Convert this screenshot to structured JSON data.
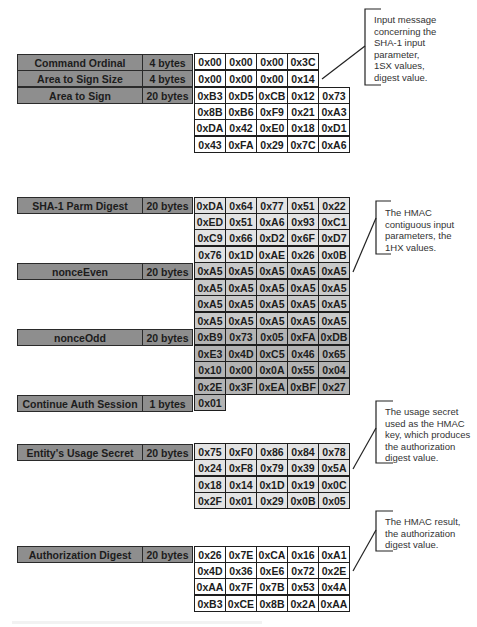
{
  "colors": {
    "label_fill": "#8e8e8e",
    "cell_white": "#ffffff",
    "cell_light": "#e3e3e3",
    "cell_mid": "#c9c9c9",
    "cell_dark": "#b3b3b3",
    "border": "#1e1e1e"
  },
  "input_message": {
    "fields": [
      {
        "label": "Command Ordinal",
        "size": "4 bytes",
        "rows": [
          [
            "0x00",
            "0x00",
            "0x00",
            "0x3C"
          ]
        ]
      },
      {
        "label": "Area to Sign Size",
        "size": "4 bytes",
        "rows": [
          [
            "0x00",
            "0x00",
            "0x00",
            "0x14"
          ]
        ]
      },
      {
        "label": "Area to Sign",
        "size": "20 bytes",
        "rows": [
          [
            "0xB3",
            "0xD5",
            "0xCB",
            "0x12",
            "0x73"
          ],
          [
            "0x8B",
            "0xB6",
            "0xF9",
            "0x21",
            "0xA3"
          ],
          [
            "0xDA",
            "0x42",
            "0xE0",
            "0x18",
            "0xD1"
          ],
          [
            "0x43",
            "0xFA",
            "0x29",
            "0x7C",
            "0xA6"
          ]
        ]
      }
    ],
    "note": [
      "Input message",
      "concerning the",
      "SHA-1 input",
      "parameter,",
      "1SX values,",
      "digest value."
    ]
  },
  "hmac_input": {
    "fields": [
      {
        "label": "SHA-1 Parm Digest",
        "size": "20 bytes",
        "rows": [
          [
            "0xDA",
            "0x64",
            "0x77",
            "0x51",
            "0x22"
          ],
          [
            "0xED",
            "0x51",
            "0xA6",
            "0x93",
            "0xC1"
          ],
          [
            "0xC9",
            "0x66",
            "0xD2",
            "0x6F",
            "0xD7"
          ],
          [
            "0x76",
            "0x1D",
            "0xAE",
            "0x26",
            "0x0B"
          ]
        ]
      },
      {
        "label": "nonceEven",
        "size": "20 bytes",
        "rows": [
          [
            "0xA5",
            "0xA5",
            "0xA5",
            "0xA5",
            "0xA5"
          ],
          [
            "0xA5",
            "0xA5",
            "0xA5",
            "0xA5",
            "0xA5"
          ],
          [
            "0xA5",
            "0xA5",
            "0xA5",
            "0xA5",
            "0xA5"
          ],
          [
            "0xA5",
            "0xA5",
            "0xA5",
            "0xA5",
            "0xA5"
          ]
        ]
      },
      {
        "label": "nonceOdd",
        "size": "20 bytes",
        "rows": [
          [
            "0xB9",
            "0x73",
            "0x05",
            "0xFA",
            "0xDB"
          ],
          [
            "0xE3",
            "0x4D",
            "0xC5",
            "0x46",
            "0x65"
          ],
          [
            "0x10",
            "0x00",
            "0x0A",
            "0x55",
            "0x04"
          ],
          [
            "0x2E",
            "0x3F",
            "0xEA",
            "0xBF",
            "0x27"
          ]
        ]
      },
      {
        "label": "Continue Auth Session",
        "size": "1 bytes",
        "rows": [
          [
            "0x01"
          ]
        ]
      }
    ],
    "note": [
      "The HMAC",
      "contiguous input",
      "parameters, the",
      "1HX values."
    ]
  },
  "usage_secret": {
    "fields": [
      {
        "label": "Entity's Usage Secret",
        "size": "20 bytes",
        "rows": [
          [
            "0x75",
            "0xF0",
            "0x86",
            "0x84",
            "0x78"
          ],
          [
            "0x24",
            "0xF8",
            "0x79",
            "0x39",
            "0x5A"
          ],
          [
            "0x18",
            "0x14",
            "0x1D",
            "0x19",
            "0x0C"
          ],
          [
            "0x2F",
            "0x01",
            "0x29",
            "0x0B",
            "0x05"
          ]
        ]
      }
    ],
    "note": [
      "The usage secret",
      "used as the HMAC",
      "key, which produces",
      "the authorization",
      "digest value."
    ]
  },
  "auth_digest": {
    "fields": [
      {
        "label": "Authorization Digest",
        "size": "20 bytes",
        "rows": [
          [
            "0x26",
            "0x7E",
            "0xCA",
            "0x16",
            "0xA1"
          ],
          [
            "0x4D",
            "0x36",
            "0xE6",
            "0x72",
            "0x2E"
          ],
          [
            "0xAA",
            "0x7F",
            "0x7B",
            "0x53",
            "0x4A"
          ],
          [
            "0xB3",
            "0xCE",
            "0x8B",
            "0x2A",
            "0xAA"
          ]
        ]
      }
    ],
    "note": [
      "The HMAC result,",
      "the authorization",
      "digest value."
    ]
  }
}
